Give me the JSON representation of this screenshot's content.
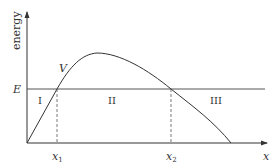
{
  "diagram": {
    "title": "",
    "y_axis_label": "energy",
    "x_axis_label": "x",
    "energy_level_label": "E",
    "curve_label": "V",
    "regions": [
      "I",
      "II",
      "III"
    ],
    "turning_points": [
      "x",
      "x"
    ],
    "turning_point_subscripts": [
      "1",
      "2"
    ],
    "colors": {
      "line": "#333333",
      "background": "#ffffff"
    }
  }
}
